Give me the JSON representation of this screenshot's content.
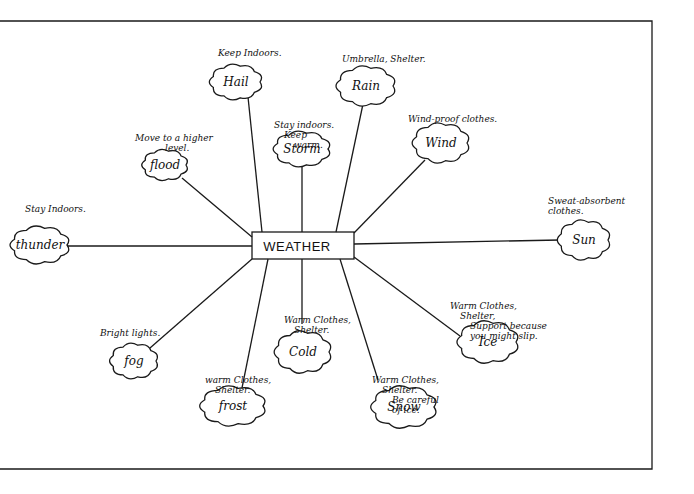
{
  "diagram": {
    "title": "WEATHER",
    "type": "mind-map",
    "center": {
      "x": 303,
      "y": 245,
      "box": {
        "x": 252,
        "y": 232,
        "w": 102,
        "h": 27
      }
    },
    "frame": {
      "top": 21,
      "right": 652,
      "bottom": 469
    },
    "nodes": [
      {
        "id": "hail",
        "label": "Hail",
        "cx": 236,
        "cy": 82,
        "rx": 24,
        "ry": 16,
        "note": [
          "Keep Indoors."
        ],
        "note_x": 218,
        "note_y": 56,
        "line": [
          262,
          232,
          248,
          97
        ]
      },
      {
        "id": "rain",
        "label": "Rain",
        "cx": 366,
        "cy": 86,
        "rx": 27,
        "ry": 18,
        "note": [
          "Umbrella, Shelter."
        ],
        "note_x": 342,
        "note_y": 62,
        "line": [
          336,
          232,
          363,
          104
        ]
      },
      {
        "id": "storm",
        "label": "Storm",
        "cx": 302,
        "cy": 149,
        "rx": 26,
        "ry": 16,
        "note": [
          "Stay indoors.",
          "Keep",
          "warm."
        ],
        "note_x": 274,
        "note_y": 128,
        "line": [
          302,
          232,
          302,
          165
        ]
      },
      {
        "id": "flood",
        "label": "flood",
        "cx": 165,
        "cy": 165,
        "rx": 21,
        "ry": 14,
        "note": [
          "Move to a higher",
          "level."
        ],
        "note_x": 135,
        "note_y": 141,
        "line": [
          252,
          237,
          182,
          178
        ]
      },
      {
        "id": "wind",
        "label": "Wind",
        "cx": 441,
        "cy": 143,
        "rx": 26,
        "ry": 18,
        "note": [
          "Wind-proof clothes."
        ],
        "note_x": 408,
        "note_y": 122,
        "line": [
          354,
          233,
          425,
          160
        ]
      },
      {
        "id": "thunder",
        "label": "thunder",
        "cx": 40,
        "cy": 245,
        "rx": 27,
        "ry": 17,
        "note": [
          "Stay Indoors."
        ],
        "note_x": 25,
        "note_y": 212,
        "line": [
          252,
          246,
          67,
          246
        ]
      },
      {
        "id": "sun",
        "label": "Sun",
        "cx": 584,
        "cy": 240,
        "rx": 24,
        "ry": 18,
        "note": [
          "Sweat-absorbent",
          "clothes."
        ],
        "note_x": 548,
        "note_y": 204,
        "line": [
          354,
          244,
          560,
          240
        ]
      },
      {
        "id": "fog",
        "label": "fog",
        "cx": 134,
        "cy": 361,
        "rx": 22,
        "ry": 16,
        "note": [
          "Bright lights."
        ],
        "note_x": 100,
        "note_y": 336,
        "line": [
          252,
          259,
          150,
          348
        ]
      },
      {
        "id": "frost",
        "label": "frost",
        "cx": 233,
        "cy": 406,
        "rx": 30,
        "ry": 18,
        "note": [
          "warm Clothes,",
          "Shelter."
        ],
        "note_x": 205,
        "note_y": 383,
        "line": [
          268,
          259,
          242,
          388
        ]
      },
      {
        "id": "cold",
        "label": "Cold",
        "cx": 303,
        "cy": 352,
        "rx": 26,
        "ry": 19,
        "note": [
          "Warm Clothes,",
          "Shelter."
        ],
        "note_x": 284,
        "note_y": 323,
        "line": [
          302,
          259,
          302,
          324
        ]
      },
      {
        "id": "snow",
        "label": "Snow",
        "cx": 404,
        "cy": 407,
        "rx": 30,
        "ry": 19,
        "note": [
          "Warm Clothes,",
          "Shelter.",
          "Be careful",
          "of ice."
        ],
        "note_x": 372,
        "note_y": 383,
        "line": [
          340,
          259,
          378,
          380
        ]
      },
      {
        "id": "ice",
        "label": "Ice",
        "cx": 488,
        "cy": 342,
        "rx": 28,
        "ry": 19,
        "note": [
          "Warm Clothes,",
          "Shelter,",
          "Support because",
          "you might slip."
        ],
        "note_x": 450,
        "note_y": 309,
        "line": [
          354,
          257,
          460,
          336
        ]
      }
    ]
  }
}
